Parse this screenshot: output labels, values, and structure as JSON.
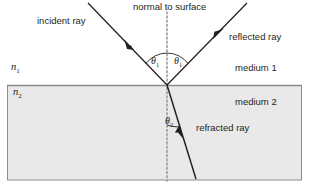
{
  "diagram": {
    "colors": {
      "ink": "#231f20",
      "medium2_fill": "#e8e8e8",
      "medium2_border": "#7f7f7f",
      "interface_line": "#808080",
      "normal_dotted": "#9a9a9a",
      "background": "#ffffff"
    },
    "labels": {
      "normal": "normal to surface",
      "incident": "incident ray",
      "reflected": "reflected ray",
      "refracted": "refracted ray",
      "medium1": "medium 1",
      "medium2": "medium 2"
    },
    "indices": {
      "n1_symbol": "n",
      "n1_sub": "1",
      "n2_symbol": "n",
      "n2_sub": "2"
    },
    "angles": {
      "theta_symbol": "θ",
      "incidence_sub": "1",
      "reflection_sub": "1",
      "refraction_sub": "2"
    },
    "geometry": {
      "interface_y": 85,
      "incidence_point_x": 167,
      "incidence_point_y": 85,
      "normal_top_y": 12,
      "normal_bottom_y": 181,
      "incident_start": [
        88,
        3
      ],
      "reflected_end": [
        247,
        3
      ],
      "refracted_end": [
        196,
        179
      ],
      "medium2_box": [
        7,
        85,
        295,
        95
      ],
      "incident_angle_deg": 45,
      "reflected_angle_deg": 45,
      "refracted_angle_deg": 17
    }
  }
}
